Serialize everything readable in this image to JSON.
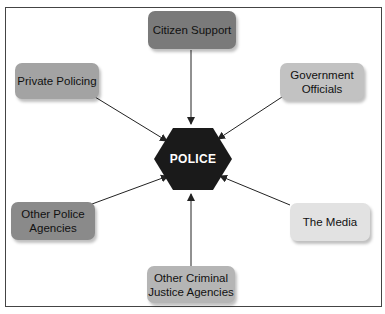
{
  "diagram": {
    "center": {
      "label": "POLICE",
      "shape": "hexagon",
      "color": "#1a1a1a",
      "text_color": "#ffffff"
    },
    "nodes": [
      {
        "id": "citizen-support",
        "label": "Citizen Support",
        "color": "#7a7a7a",
        "position": "top"
      },
      {
        "id": "private-policing",
        "label": "Private Policing",
        "color": "#a3a3a3",
        "position": "top-left"
      },
      {
        "id": "government-officials",
        "label": "Government Officials",
        "label_lines": [
          "Government",
          "Officials"
        ],
        "color": "#c2c2c2",
        "position": "top-right"
      },
      {
        "id": "other-police-agencies",
        "label": "Other Police Agencies",
        "label_lines": [
          "Other Police",
          "Agencies"
        ],
        "color": "#8a8a8a",
        "position": "bottom-left"
      },
      {
        "id": "the-media",
        "label": "The Media",
        "color": "#e2e2e2",
        "position": "bottom-right"
      },
      {
        "id": "other-criminal-justice-agencies",
        "label": "Other Criminal Justice Agencies",
        "label_lines": [
          "Other Criminal",
          "Justice Agencies"
        ],
        "color": "#b5b5b5",
        "position": "bottom"
      }
    ],
    "edges": [
      {
        "from": "citizen-support",
        "to": "POLICE",
        "arrow": "to"
      },
      {
        "from": "private-policing",
        "to": "POLICE",
        "arrow": "to"
      },
      {
        "from": "government-officials",
        "to": "POLICE",
        "arrow": "to"
      },
      {
        "from": "other-police-agencies",
        "to": "POLICE",
        "arrow": "to"
      },
      {
        "from": "the-media",
        "to": "POLICE",
        "arrow": "to"
      },
      {
        "from": "other-criminal-justice-agencies",
        "to": "POLICE",
        "arrow": "to"
      }
    ]
  }
}
